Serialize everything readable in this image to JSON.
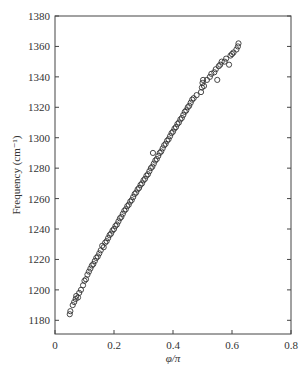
{
  "chart_data": {
    "type": "scatter",
    "title": "",
    "xlabel": "φ/π",
    "ylabel": "Frequency (cm⁻¹)",
    "xlim": [
      0,
      0.8
    ],
    "ylim": [
      1171,
      1380
    ],
    "grid": false,
    "legend": null,
    "marker": "open-circle",
    "x_ticks": [
      0,
      0.2,
      0.4,
      0.6,
      0.8
    ],
    "x_tick_labels": [
      "0",
      "0.2",
      "0.4",
      "0.6",
      "0.8"
    ],
    "y_ticks": [
      1180,
      1200,
      1220,
      1240,
      1260,
      1280,
      1300,
      1320,
      1340,
      1360,
      1380
    ],
    "y_tick_labels": [
      "1180",
      "1200",
      "1220",
      "1240",
      "1260",
      "1280",
      "1300",
      "1320",
      "1340",
      "1360",
      "1380"
    ],
    "series": [
      {
        "name": "data",
        "points": [
          [
            0.05,
            1184
          ],
          [
            0.052,
            1186
          ],
          [
            0.06,
            1190
          ],
          [
            0.065,
            1192
          ],
          [
            0.07,
            1194
          ],
          [
            0.072,
            1196
          ],
          [
            0.078,
            1195
          ],
          [
            0.082,
            1198
          ],
          [
            0.088,
            1200
          ],
          [
            0.095,
            1203
          ],
          [
            0.1,
            1206
          ],
          [
            0.105,
            1207
          ],
          [
            0.11,
            1210
          ],
          [
            0.115,
            1212
          ],
          [
            0.12,
            1214
          ],
          [
            0.125,
            1216
          ],
          [
            0.13,
            1217
          ],
          [
            0.135,
            1219
          ],
          [
            0.14,
            1221
          ],
          [
            0.145,
            1222
          ],
          [
            0.15,
            1224
          ],
          [
            0.155,
            1226
          ],
          [
            0.16,
            1229
          ],
          [
            0.165,
            1228
          ],
          [
            0.17,
            1231
          ],
          [
            0.175,
            1232
          ],
          [
            0.18,
            1234
          ],
          [
            0.185,
            1236
          ],
          [
            0.19,
            1237
          ],
          [
            0.195,
            1239
          ],
          [
            0.2,
            1240
          ],
          [
            0.205,
            1242
          ],
          [
            0.21,
            1243
          ],
          [
            0.215,
            1245
          ],
          [
            0.22,
            1247
          ],
          [
            0.225,
            1248
          ],
          [
            0.23,
            1250
          ],
          [
            0.235,
            1252
          ],
          [
            0.24,
            1253
          ],
          [
            0.245,
            1255
          ],
          [
            0.25,
            1256
          ],
          [
            0.255,
            1258
          ],
          [
            0.26,
            1259
          ],
          [
            0.265,
            1261
          ],
          [
            0.27,
            1263
          ],
          [
            0.275,
            1264
          ],
          [
            0.28,
            1266
          ],
          [
            0.285,
            1267
          ],
          [
            0.29,
            1269
          ],
          [
            0.295,
            1270
          ],
          [
            0.3,
            1272
          ],
          [
            0.305,
            1273
          ],
          [
            0.31,
            1275
          ],
          [
            0.315,
            1276
          ],
          [
            0.32,
            1278
          ],
          [
            0.325,
            1280
          ],
          [
            0.33,
            1281
          ],
          [
            0.332,
            1290
          ],
          [
            0.335,
            1283
          ],
          [
            0.34,
            1285
          ],
          [
            0.345,
            1286
          ],
          [
            0.35,
            1288
          ],
          [
            0.355,
            1290
          ],
          [
            0.36,
            1291
          ],
          [
            0.365,
            1293
          ],
          [
            0.37,
            1295
          ],
          [
            0.375,
            1296
          ],
          [
            0.38,
            1298
          ],
          [
            0.385,
            1299
          ],
          [
            0.39,
            1301
          ],
          [
            0.395,
            1303
          ],
          [
            0.4,
            1304
          ],
          [
            0.405,
            1306
          ],
          [
            0.41,
            1307
          ],
          [
            0.415,
            1309
          ],
          [
            0.42,
            1310
          ],
          [
            0.425,
            1312
          ],
          [
            0.43,
            1313
          ],
          [
            0.435,
            1315
          ],
          [
            0.44,
            1317
          ],
          [
            0.445,
            1318
          ],
          [
            0.45,
            1320
          ],
          [
            0.455,
            1321
          ],
          [
            0.46,
            1323
          ],
          [
            0.465,
            1325
          ],
          [
            0.47,
            1326
          ],
          [
            0.48,
            1328
          ],
          [
            0.495,
            1330
          ],
          [
            0.498,
            1333
          ],
          [
            0.5,
            1336
          ],
          [
            0.502,
            1338
          ],
          [
            0.505,
            1334
          ],
          [
            0.515,
            1338
          ],
          [
            0.525,
            1340
          ],
          [
            0.53,
            1342
          ],
          [
            0.54,
            1343
          ],
          [
            0.545,
            1345
          ],
          [
            0.55,
            1338
          ],
          [
            0.555,
            1347
          ],
          [
            0.56,
            1348
          ],
          [
            0.565,
            1350
          ],
          [
            0.575,
            1350
          ],
          [
            0.58,
            1352
          ],
          [
            0.59,
            1348
          ],
          [
            0.595,
            1354
          ],
          [
            0.6,
            1355
          ],
          [
            0.605,
            1356
          ],
          [
            0.615,
            1358
          ],
          [
            0.62,
            1360
          ],
          [
            0.622,
            1362
          ]
        ]
      }
    ]
  }
}
